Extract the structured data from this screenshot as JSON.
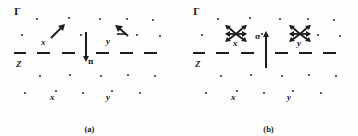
{
  "figure": {
    "type": "schematic-diagram"
  },
  "panels": [
    {
      "id": "a",
      "caption": "(a)",
      "labels": {
        "gamma": "Γ",
        "zone_left": "Z",
        "zone_center": "π",
        "x_upper": "x",
        "y_upper": "y",
        "x_lower": "x",
        "y_lower": "y"
      },
      "symbols": [
        {
          "name": "single-arrow-up-right",
          "at": "x"
        },
        {
          "name": "single-arrow-up-left",
          "at": "y"
        },
        {
          "name": "vertical-arrow-down",
          "at": "zone-center"
        }
      ]
    },
    {
      "id": "b",
      "caption": "(b)",
      "labels": {
        "gamma": "Γ",
        "zone_left": "Z",
        "zone_center": "σ",
        "x_upper": "x",
        "y_upper": "y",
        "x_lower": "x",
        "y_lower": "y"
      },
      "symbols": [
        {
          "name": "multi-arrow-star",
          "at": "x"
        },
        {
          "name": "multi-arrow-star",
          "at": "y"
        },
        {
          "name": "vertical-arrow-up",
          "at": "zone-center"
        }
      ]
    }
  ],
  "lattice": {
    "rows": 5,
    "columns": 6,
    "dot_color": "#2a2a2a"
  },
  "lines": {
    "dashed_midline_color": "#1d1d1d",
    "dashed_segments": 6,
    "vertical_line_color": "#1d1d1d"
  },
  "colors": {
    "background": "#fefefe",
    "ink": "#1d1d1d"
  }
}
